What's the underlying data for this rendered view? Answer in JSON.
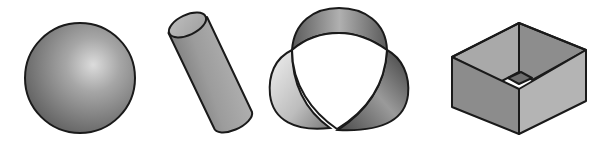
{
  "figure": {
    "shapes": [
      {
        "id": "sphere",
        "label": "Sphere"
      },
      {
        "id": "cylinder",
        "label": "Cylinder"
      },
      {
        "id": "trefoil-surface",
        "label": "Three-lobed twisted band"
      },
      {
        "id": "open-box",
        "label": "Open box"
      }
    ]
  },
  "colors": {
    "outline": "#1a1a1a",
    "sphere_highlight": "#d8d8d8",
    "sphere_shadow": "#5a5a5a",
    "cylinder_light": "#b8b8b8",
    "cylinder_dark": "#7a7a7a",
    "box_left": "#8c8c8c",
    "box_right": "#b4b4b4",
    "box_inner_back_left": "#a8a8a8",
    "box_inner_back_right": "#8a8a8a",
    "box_floor": "#6e6e6e"
  }
}
